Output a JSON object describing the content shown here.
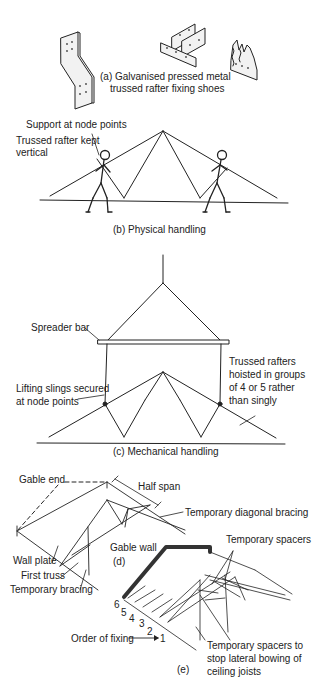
{
  "figure": {
    "panels": {
      "a": {
        "caption_line1": "(a) Galvanised pressed metal",
        "caption_line2": "trussed rafter fixing shoes"
      },
      "b": {
        "caption": "(b) Physical handling",
        "labels": {
          "support": "Support at node points",
          "vertical_line1": "Trussed rafter kept",
          "vertical_line2": "vertical"
        }
      },
      "c": {
        "caption": "(c) Mechanical handling",
        "labels": {
          "spreader": "Spreader bar",
          "slings_line1": "Lifting slings secured",
          "slings_line2": "at node points",
          "hoisted_line1": "Trussed rafters",
          "hoisted_line2": "hoisted in groups",
          "hoisted_line3": "of 4 or 5 rather",
          "hoisted_line4": "than singly"
        }
      },
      "d": {
        "caption": "(d)",
        "labels": {
          "gable_end": "Gable end",
          "half_span": "Half span",
          "diagonal_bracing": "Temporary diagonal bracing",
          "wall_plate": "Wall plate",
          "first_truss": "First truss",
          "temp_bracing": "Temporary bracing"
        }
      },
      "e": {
        "caption": "(e)",
        "labels": {
          "gable_wall": "Gable wall",
          "temp_spacers": "Temporary spacers",
          "order_of_fixing": "Order of fixing",
          "spacers_line1": "Temporary spacers to",
          "spacers_line2": "stop lateral bowing of",
          "spacers_line3": "ceiling joists"
        },
        "fixing_order": [
          "6",
          "5",
          "4",
          "3",
          "2",
          "1"
        ]
      }
    }
  }
}
